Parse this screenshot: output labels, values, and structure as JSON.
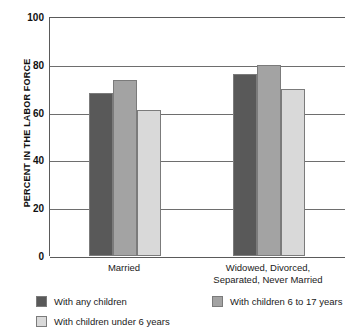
{
  "chart_data": {
    "type": "bar",
    "title": "",
    "xlabel": "",
    "ylabel": "PERCENT IN THE LABOR FORCE",
    "ylim": [
      0,
      100
    ],
    "yticks": [
      0,
      20,
      40,
      60,
      80,
      100
    ],
    "ytick_labels": [
      "0",
      "20",
      "40",
      "60",
      "80",
      "100"
    ],
    "grid": true,
    "legend_position": "bottom",
    "categories": [
      "Married",
      "Widowed, Divorced, Separated, Never Married"
    ],
    "category_lines": [
      [
        "Married"
      ],
      [
        "Widowed, Divorced,",
        "Separated, Never Married"
      ]
    ],
    "series": [
      {
        "name": "With any children",
        "color": "#595959",
        "values": [
          68,
          76
        ]
      },
      {
        "name": "With children under 6 years",
        "color": "#d9d9d9",
        "values": [
          61,
          70
        ]
      },
      {
        "name": "With children 6 to 17 years",
        "color": "#a3a3a3",
        "values": [
          73.5,
          80
        ]
      }
    ],
    "bar_draw_order": [
      {
        "series": "With any children",
        "color": "#595959"
      },
      {
        "series": "With children 6 to 17 years",
        "color": "#a3a3a3"
      },
      {
        "series": "With children under 6 years",
        "color": "#d9d9d9"
      }
    ],
    "legend_entries": [
      {
        "label": "With any children",
        "color": "#595959"
      },
      {
        "label": "With children 6 to 17 years",
        "color": "#a3a3a3"
      },
      {
        "label": "With children under 6 years",
        "color": "#d9d9d9"
      }
    ],
    "axis_color": "#5a5a5a",
    "gridline_color": "#6e6e6e",
    "bar_border_color": "#7b7b7b",
    "background": "#ffffff"
  }
}
